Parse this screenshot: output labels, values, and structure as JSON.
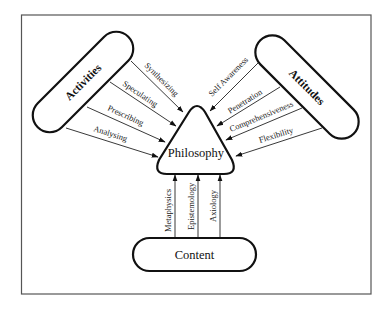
{
  "diagram": {
    "type": "concept-map",
    "nodes": {
      "activities": {
        "label": "Activities",
        "shape": "rotated-pill"
      },
      "attitudes": {
        "label": "Attitudes",
        "shape": "rotated-pill"
      },
      "philosophy": {
        "label": "Philosophy",
        "shape": "rounded-triangle"
      },
      "content": {
        "label": "Content",
        "shape": "pill"
      }
    },
    "edges": {
      "activities": [
        {
          "label": "Synthesizing",
          "from": "Activities",
          "to": "Philosophy"
        },
        {
          "label": "Speculating",
          "from": "Activities",
          "to": "Philosophy"
        },
        {
          "label": "Prescribing",
          "from": "Activities",
          "to": "Philosophy"
        },
        {
          "label": "Analysing",
          "from": "Activities",
          "to": "Philosophy"
        }
      ],
      "attitudes": [
        {
          "label": "Self Awareness",
          "from": "Attitudes",
          "to": "Philosophy"
        },
        {
          "label": "Penetration",
          "from": "Attitudes",
          "to": "Philosophy"
        },
        {
          "label": "Comprehensiveness",
          "from": "Attitudes",
          "to": "Philosophy"
        },
        {
          "label": "Flexibility",
          "from": "Attitudes",
          "to": "Philosophy"
        }
      ],
      "content": [
        {
          "label": "Metaphysics",
          "from": "Content",
          "to": "Philosophy"
        },
        {
          "label": "Epistemology",
          "from": "Content",
          "to": "Philosophy"
        },
        {
          "label": "Axiology",
          "from": "Content",
          "to": "Philosophy"
        }
      ]
    },
    "colors": {
      "stroke": "#111111",
      "frame": "#555555",
      "background": "#ffffff"
    }
  }
}
